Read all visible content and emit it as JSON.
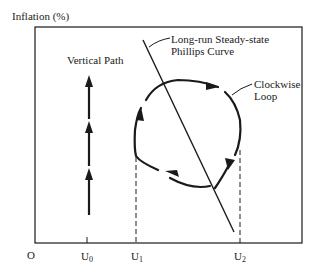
{
  "diagram": {
    "y_axis_label": "Inflation (%)",
    "origin_label": "O",
    "x_ticks": [
      {
        "base": "U",
        "sub": "0"
      },
      {
        "base": "U",
        "sub": "1"
      },
      {
        "base": "U",
        "sub": "2"
      }
    ],
    "annotations": {
      "vertical_path": "Vertical Path",
      "phillips_line1": "Long-run Steady-state",
      "phillips_line2": "Phillips Curve",
      "loop_line1": "Clockwise",
      "loop_line2": "Loop"
    },
    "colors": {
      "ink": "#1a1a1a",
      "background": "#ffffff"
    }
  }
}
